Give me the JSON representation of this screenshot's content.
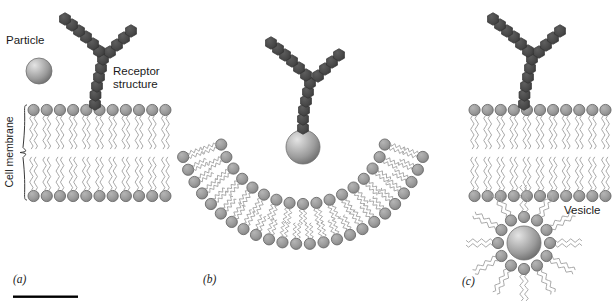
{
  "figure": {
    "background_color": "#ffffff",
    "width": 612,
    "height": 304
  },
  "labels": {
    "particle": "Particle",
    "receptor_line1": "Receptor",
    "receptor_line2": "structure",
    "cell_membrane": "Cell membrane",
    "vesicle": "Vesicle"
  },
  "panels": [
    {
      "id": "a",
      "label": "(a)",
      "caption": "Particle binds receptor on flat membrane"
    },
    {
      "id": "b",
      "label": "(b)",
      "caption": "Membrane invaginates around particle"
    },
    {
      "id": "c",
      "label": "(c)",
      "caption": "Vesicle pinches off inside cell"
    }
  ],
  "colors": {
    "lipid_head_fill": "#9a9a9a",
    "lipid_head_stroke": "#6b6b6b",
    "lipid_tail_stroke": "#a8a8a8",
    "receptor_fill": "#4a4a4a",
    "receptor_stroke": "#333333",
    "particle_light": "#d8d8d8",
    "particle_mid": "#9e9e9e",
    "particle_dark": "#6f6f6f",
    "scale_bar": "#000000",
    "text": "#1a1a1a"
  },
  "geometry": {
    "panel_a": {
      "membrane_x_start": 27,
      "membrane_x_end": 172,
      "membrane_top_y": 110,
      "membrane_bottom_y": 196,
      "lipid_count": 11,
      "head_radius": 5.6,
      "particle": {
        "cx": 39,
        "cy": 71,
        "r": 13
      },
      "receptor_stem_base": {
        "x": 95,
        "y": 106
      },
      "brace_x": 22,
      "brace_top": 105,
      "brace_bottom": 200
    },
    "panel_b": {
      "arc_center_x": 303,
      "arc_center_y": 118,
      "outer_radius": 126,
      "inner_radius": 86,
      "arc_start_deg": 18,
      "arc_end_deg": 162,
      "outer_lipid_count": 24,
      "inner_lipid_count": 17,
      "head_radius": 5.6,
      "particle": {
        "cx": 303,
        "cy": 147,
        "r": 17
      },
      "receptor_stem_base": {
        "x": 303,
        "y": 130
      }
    },
    "panel_c": {
      "membrane_x_start": 468,
      "membrane_x_end": 612,
      "membrane_top_y": 110,
      "membrane_bottom_y": 196,
      "lipid_count": 11,
      "head_radius": 5.6,
      "receptor_stem_base": {
        "x": 524,
        "y": 106
      },
      "vesicle": {
        "cx": 524,
        "cy": 243,
        "particle_r": 17,
        "head_ring_r": 26,
        "head_count": 12,
        "head_radius": 5.6,
        "tail_length": 26
      }
    },
    "scale_bar": {
      "x1": 13,
      "x2": 78,
      "y": 297,
      "thickness": 2.4
    },
    "panel_label_positions": {
      "a": {
        "x": 13,
        "y": 283
      },
      "b": {
        "x": 203,
        "y": 283
      },
      "c": {
        "x": 462,
        "y": 285
      }
    },
    "text_positions": {
      "particle": {
        "x": 6,
        "y": 44
      },
      "receptor": {
        "x": 113,
        "y": 75
      },
      "cell_membrane": {
        "x": 13,
        "y": 152
      },
      "vesicle": {
        "x": 564,
        "y": 214
      }
    }
  },
  "receptor_chain": {
    "description": "Y-shaped chain of dark hexagon subunits",
    "panel_a": {
      "stem": [
        [
          95,
          104
        ],
        [
          95.5,
          95
        ],
        [
          97,
          86
        ],
        [
          99,
          77
        ],
        [
          101,
          68
        ],
        [
          103,
          59
        ]
      ],
      "left_arm": [
        [
          99,
          51
        ],
        [
          93,
          44
        ],
        [
          86,
          37
        ],
        [
          79,
          31
        ],
        [
          72,
          25
        ],
        [
          65,
          19
        ]
      ],
      "right_arm": [
        [
          110,
          52
        ],
        [
          117,
          45
        ],
        [
          124,
          38
        ],
        [
          131,
          31
        ]
      ]
    },
    "panel_b": {
      "stem": [
        [
          303,
          128
        ],
        [
          303,
          119
        ],
        [
          304,
          110
        ],
        [
          306,
          101
        ],
        [
          308,
          92
        ],
        [
          310,
          83
        ]
      ],
      "left_arm": [
        [
          306,
          75
        ],
        [
          299,
          68
        ],
        [
          292,
          61
        ],
        [
          285,
          55
        ],
        [
          278,
          49
        ],
        [
          271,
          43
        ]
      ],
      "right_arm": [
        [
          318,
          76
        ],
        [
          325,
          69
        ],
        [
          332,
          62
        ],
        [
          339,
          55
        ]
      ]
    },
    "panel_c": {
      "stem": [
        [
          524,
          104
        ],
        [
          524.5,
          95
        ],
        [
          526,
          86
        ],
        [
          528,
          77
        ],
        [
          530,
          68
        ],
        [
          532,
          59
        ]
      ],
      "left_arm": [
        [
          528,
          51
        ],
        [
          521,
          44
        ],
        [
          514,
          37
        ],
        [
          507,
          31
        ],
        [
          500,
          25
        ],
        [
          493,
          19
        ]
      ],
      "right_arm": [
        [
          539,
          52
        ],
        [
          546,
          45
        ],
        [
          553,
          38
        ],
        [
          560,
          31
        ]
      ]
    },
    "hex_radius": 6.3
  }
}
